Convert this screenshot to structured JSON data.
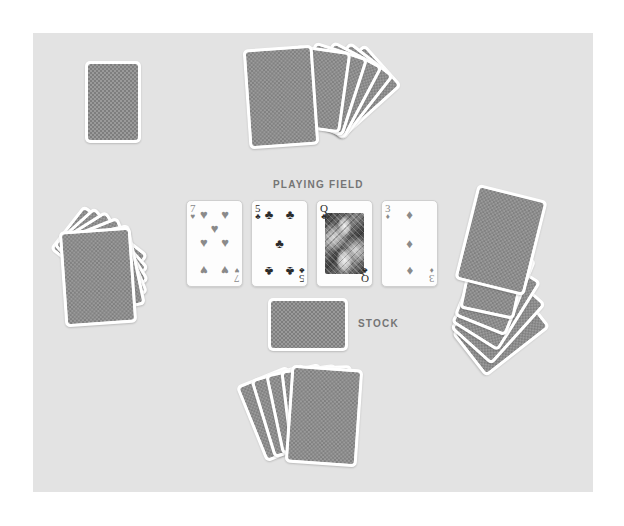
{
  "surface": {
    "background_color": "#e3e3e3",
    "page_background_color": "#ffffff"
  },
  "labels": {
    "playing_field": "PLAYING FIELD",
    "stock": "STOCK"
  },
  "playing_field": {
    "cards": [
      {
        "rank": "7",
        "suit": "hearts",
        "suit_symbol": "♥",
        "color": "#8a8a8a",
        "face_up": true,
        "pip_count": 7
      },
      {
        "rank": "5",
        "suit": "clubs",
        "suit_symbol": "♣",
        "color": "#2b2b2b",
        "face_up": true,
        "pip_count": 5
      },
      {
        "rank": "Q",
        "suit": "clubs",
        "suit_symbol": "♣",
        "color": "#2b2b2b",
        "face_up": true,
        "court": true
      },
      {
        "rank": "3",
        "suit": "diamonds",
        "suit_symbol": "♦",
        "color": "#8a8a8a",
        "face_up": true,
        "pip_count": 3
      }
    ]
  },
  "stock": {
    "face_up": false,
    "orientation": "landscape",
    "card_count": 1
  },
  "hands": {
    "top": {
      "card_count": 6,
      "face_up": false
    },
    "left": {
      "card_count": 6,
      "face_up": false
    },
    "right": {
      "card_count": 6,
      "face_up": false
    },
    "bottom": {
      "card_count": 6,
      "face_up": false
    }
  }
}
